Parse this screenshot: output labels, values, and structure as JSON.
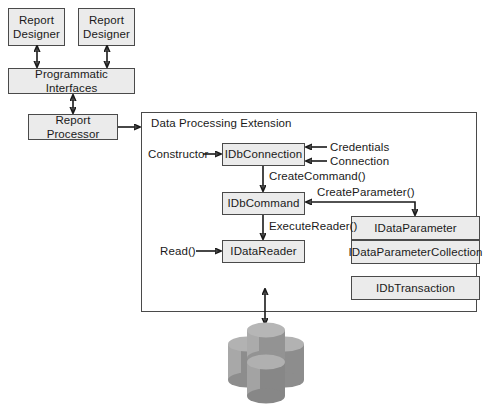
{
  "diagram": {
    "type": "block-diagram",
    "colors": {
      "node_fill": "#ebebeb",
      "node_border": "#4a4a4a",
      "container_fill": "#ffffff",
      "line": "#1a1a1a",
      "cylinder_light": "#b4b4b4",
      "cylinder_mid": "#9a9a9a",
      "cylinder_dark": "#7d7d7d"
    }
  },
  "top_nodes": {
    "report_designer_left": {
      "line1": "Report",
      "line2": "Designer"
    },
    "report_designer_right": {
      "line1": "Report",
      "line2": "Designer"
    },
    "programmatic_interfaces": "Programmatic Interfaces",
    "report_processor": "Report Processor"
  },
  "extension": {
    "title": "Data Processing Extension",
    "interfaces": {
      "db_connection": "IDbConnection",
      "db_command": "IDbCommand",
      "data_reader": "IDataReader",
      "data_parameter": "IDataParameter",
      "data_parameter_collection": "IDataParameterCollection",
      "db_transaction": "IDbTransaction"
    },
    "labels": {
      "constructor": "Constructor",
      "credentials": "Credentials",
      "connection": "Connection",
      "create_command": "CreateCommand()",
      "create_parameter": "CreateParameter()",
      "execute_reader": "ExecuteReader()",
      "read": "Read()"
    }
  },
  "datastore": {
    "name": "database-cluster",
    "cylinder_count": 4
  }
}
